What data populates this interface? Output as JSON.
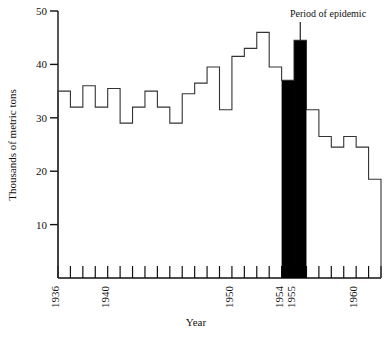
{
  "chart_data": {
    "type": "bar",
    "title": "",
    "subtitle": "",
    "xlabel": "Year",
    "ylabel": "Thousands of metric tons",
    "xlim": [
      1936,
      1962
    ],
    "ylim": [
      0,
      50
    ],
    "grid": false,
    "legend": "none",
    "style": "step-histogram, outlined bars, epidemic years filled black",
    "x_tick_labels": [
      "1936",
      "1940",
      "1950",
      "1954",
      "1955",
      "1960"
    ],
    "x_tick_values": [
      1936,
      1940,
      1950,
      1954,
      1955,
      1960
    ],
    "x_minor_ticks_every": 1,
    "y_tick_labels": [
      "10",
      "20",
      "30",
      "40",
      "50"
    ],
    "y_tick_values": [
      10,
      20,
      30,
      40,
      50
    ],
    "categories": [
      1936,
      1937,
      1938,
      1939,
      1940,
      1941,
      1942,
      1943,
      1944,
      1945,
      1946,
      1947,
      1948,
      1949,
      1950,
      1951,
      1952,
      1953,
      1954,
      1955,
      1956,
      1957,
      1958,
      1959,
      1960,
      1961
    ],
    "values": [
      35.0,
      32.0,
      36.0,
      32.0,
      35.5,
      29.0,
      32.0,
      35.0,
      32.0,
      29.0,
      34.5,
      36.5,
      39.5,
      31.5,
      41.5,
      43.0,
      46.0,
      39.5,
      37.0,
      44.5,
      31.5,
      26.5,
      24.5,
      26.5,
      24.5,
      18.5
    ],
    "highlight_years": [
      1954,
      1955
    ],
    "highlight_color": "#000000",
    "bar_outline_color": "#333333",
    "background_color": "#ffffff",
    "annotations": [
      {
        "text": "Period of epidemic",
        "target_year": 1955,
        "pointer": "down-arrow"
      }
    ]
  },
  "labels": {
    "annotation_epidemic": "Period of epidemic",
    "axis_x_title": "Year",
    "axis_y_title": "Thousands of metric tons"
  }
}
